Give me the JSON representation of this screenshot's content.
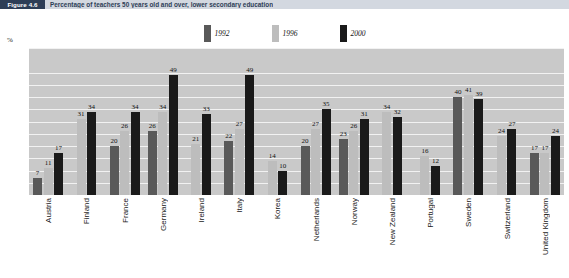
{
  "header": {
    "figure_tag": "Figure 4.6",
    "title": "Percentage of teachers 50 years old and over, lower secondary education"
  },
  "axis_unit": "%",
  "legend": [
    {
      "label": "1992",
      "color": "#595959"
    },
    {
      "label": "1996",
      "color": "#bdbdbd"
    },
    {
      "label": "2000",
      "color": "#1a1a1a"
    }
  ],
  "chart_data": {
    "type": "bar",
    "title": "Percentage of teachers 50 years old and over, lower secondary education",
    "xlabel": "",
    "ylabel": "%",
    "ylim": [
      0,
      60
    ],
    "grid": true,
    "legend_position": "top-center",
    "yticks": [
      0,
      5,
      10,
      15,
      20,
      25,
      30,
      35,
      40,
      45,
      50,
      60
    ],
    "categories": [
      "Austria",
      "Finland",
      "France",
      "Germany",
      "Ireland",
      "Italy",
      "Korea",
      "Netherlands",
      "Norway",
      "New Zealand",
      "Portugal",
      "Sweden",
      "Switzerland",
      "United Kingdom"
    ],
    "series": [
      {
        "name": "1992",
        "color": "#595959",
        "values": [
          7,
          null,
          20,
          26,
          null,
          22,
          null,
          20,
          23,
          null,
          null,
          40,
          null,
          17
        ]
      },
      {
        "name": "1996",
        "color": "#bdbdbd",
        "values": [
          11,
          31,
          26,
          34,
          21,
          27,
          14,
          27,
          26,
          34,
          16,
          41,
          24,
          17
        ]
      },
      {
        "name": "2000",
        "color": "#1a1a1a",
        "values": [
          17,
          34,
          34,
          49,
          33,
          49,
          10,
          35,
          31,
          32,
          12,
          39,
          27,
          24
        ]
      }
    ]
  }
}
